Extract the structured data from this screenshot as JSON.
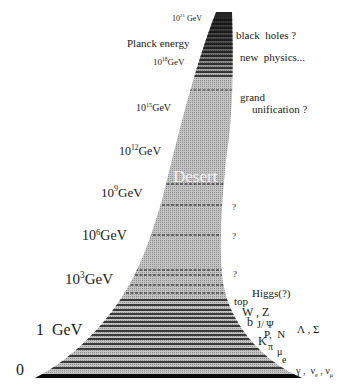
{
  "diagram": {
    "desert_label": "Desert",
    "colors": {
      "shape_fill": "#b8b8b8",
      "shape_dark": "#1a1a1a",
      "text": "#1a1a1a",
      "desert_text": "#f2f2f2",
      "background": "#ffffff"
    }
  },
  "left_labels": [
    {
      "id": "e21",
      "base": "10",
      "exp": "21",
      "unit": "GeV"
    },
    {
      "id": "planck",
      "text": "Planck energy"
    },
    {
      "id": "e18",
      "base": "10",
      "exp": "18",
      "unit": "GeV"
    },
    {
      "id": "e15",
      "base": "10",
      "exp": "15",
      "unit": "GeV"
    },
    {
      "id": "e12",
      "base": "10",
      "exp": "12",
      "unit": "GeV"
    },
    {
      "id": "e9",
      "base": "10",
      "exp": "9",
      "unit": "GeV"
    },
    {
      "id": "e6",
      "base": "10",
      "exp": "6",
      "unit": "GeV"
    },
    {
      "id": "e3",
      "base": "10",
      "exp": "3",
      "unit": "GeV"
    },
    {
      "id": "one",
      "text": "1  GeV"
    },
    {
      "id": "zero",
      "text": "0"
    }
  ],
  "right_labels": {
    "black_holes": "black  holes ?",
    "new_physics": "new  physics...",
    "grand": "grand",
    "unification": "unification ?",
    "q1": "?",
    "q2": "?",
    "q3": "?",
    "higgs": "Higgs(?)",
    "top": "top",
    "wz": "W , Z",
    "b": "b",
    "jpsi": "J/ Ψ",
    "lambda_sigma": "Λ , Σ",
    "p_n": "P,  N",
    "k": "K",
    "pi": "π",
    "mu": "μ",
    "e": "e",
    "gamma": "γ ,",
    "nu_e": "ν",
    "nu_e_sub": "e",
    "nu_mu": ", ν",
    "nu_mu_sub": "μ"
  }
}
